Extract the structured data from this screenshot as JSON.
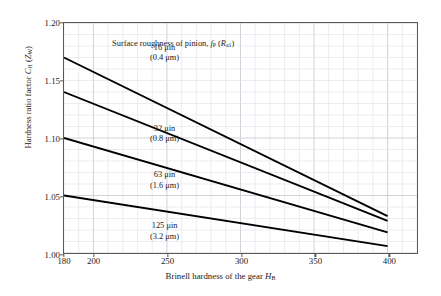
{
  "chart_data": {
    "type": "line",
    "title": "",
    "xlabel": "Brinell hardness of the gear H_B",
    "ylabel": "Hardness ratio factor C_H (Z_W)",
    "xlim": [
      180,
      420
    ],
    "ylim": [
      1.0,
      1.2
    ],
    "x_ticks": [
      180,
      200,
      250,
      300,
      350,
      400
    ],
    "y_ticks": [
      "1.00",
      "1.05",
      "1.10",
      "1.15",
      "1.20"
    ],
    "x_major_gridlines": [
      200,
      250,
      300,
      350,
      400
    ],
    "x_minor_gridline_step": 10,
    "y_gridline_step": 0.01,
    "grid": true,
    "legend_position": "inline-annotations",
    "annotation": "Surface roughness of pinion, f_P (R_a1)",
    "series": [
      {
        "name": "16 uin (0.4 um)",
        "label_line1": "16 μin",
        "label_line2": "(0.4 μm)",
        "x": [
          180,
          400
        ],
        "y": [
          1.17,
          1.032
        ]
      },
      {
        "name": "32 uin (0.8 um)",
        "label_line1": "32 μin",
        "label_line2": "(0.8 μm)",
        "x": [
          180,
          400
        ],
        "y": [
          1.14,
          1.028
        ]
      },
      {
        "name": "63 uin (1.6 um)",
        "label_line1": "63 μin",
        "label_line2": "(1.6 μm)",
        "x": [
          180,
          400
        ],
        "y": [
          1.1,
          1.018
        ]
      },
      {
        "name": "125 uin (3.2 um)",
        "label_line1": "125 μin",
        "label_line2": "(3.2 μm)",
        "x": [
          180,
          400
        ],
        "y": [
          1.05,
          1.006
        ]
      }
    ]
  },
  "axis": {
    "y_ticks": [
      "1.00",
      "1.05",
      "1.10",
      "1.15",
      "1.20"
    ],
    "x_ticks": [
      "180",
      "200",
      "250",
      "300",
      "350",
      "400"
    ],
    "ylabel_pre": "Hardness ratio factor ",
    "ylabel_sym1": "C",
    "ylabel_sub1": "H",
    "ylabel_mid": " (",
    "ylabel_sym2": "Z",
    "ylabel_sub2": "W",
    "ylabel_post": ")",
    "xlabel_pre": "Brinell hardness of the gear ",
    "xlabel_sym": "H",
    "xlabel_sub": "B"
  },
  "note": {
    "pre": "Surface roughness of pinion, ",
    "sym1": "f",
    "sub1": "P",
    "mid": " (",
    "sym2": "R",
    "sub2": "a1",
    "post": ")"
  },
  "colors": {
    "frame": "#58585a",
    "grid_major": "#c9cdd4",
    "grid_minor": "#e2e5ea",
    "curve": "#000000",
    "text": "#1a1a1a",
    "background": "#ffffff"
  }
}
